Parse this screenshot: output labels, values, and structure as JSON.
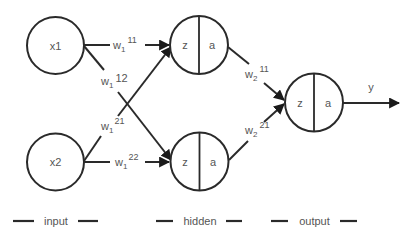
{
  "diagram": {
    "type": "neural-network",
    "colors": {
      "stroke": "#2a2a2a",
      "text": "#555555",
      "background": "#ffffff"
    },
    "inputs": [
      {
        "id": "x1",
        "label": "x1"
      },
      {
        "id": "x2",
        "label": "x2"
      }
    ],
    "hidden": [
      {
        "id": "h1",
        "z_label": "z",
        "a_label": "a"
      },
      {
        "id": "h2",
        "z_label": "z",
        "a_label": "a"
      }
    ],
    "output": {
      "id": "o",
      "z_label": "z",
      "a_label": "a",
      "out_label": "y"
    },
    "weights": {
      "w1_11": {
        "base": "w",
        "sub": "1",
        "sup": "11"
      },
      "w1_12": {
        "base": "w",
        "sub": "1",
        "sup": "12"
      },
      "w1_21": {
        "base": "w",
        "sub": "1",
        "sup": "21"
      },
      "w1_22": {
        "base": "w",
        "sub": "1",
        "sup": "22"
      },
      "w2_11": {
        "base": "w",
        "sub": "2",
        "sup": "11"
      },
      "w2_21": {
        "base": "w",
        "sub": "2",
        "sup": "21"
      }
    },
    "edges": [
      {
        "from": "x1",
        "to": "h1",
        "weight": "w1_11"
      },
      {
        "from": "x1",
        "to": "h2",
        "weight": "w1_12"
      },
      {
        "from": "x2",
        "to": "h1",
        "weight": "w1_21"
      },
      {
        "from": "x2",
        "to": "h2",
        "weight": "w1_22"
      },
      {
        "from": "h1",
        "to": "o",
        "weight": "w2_11"
      },
      {
        "from": "h2",
        "to": "o",
        "weight": "w2_21"
      },
      {
        "from": "o",
        "to": "y",
        "weight": null
      }
    ],
    "layers": {
      "input": "input",
      "hidden": "hidden",
      "output": "output"
    }
  }
}
